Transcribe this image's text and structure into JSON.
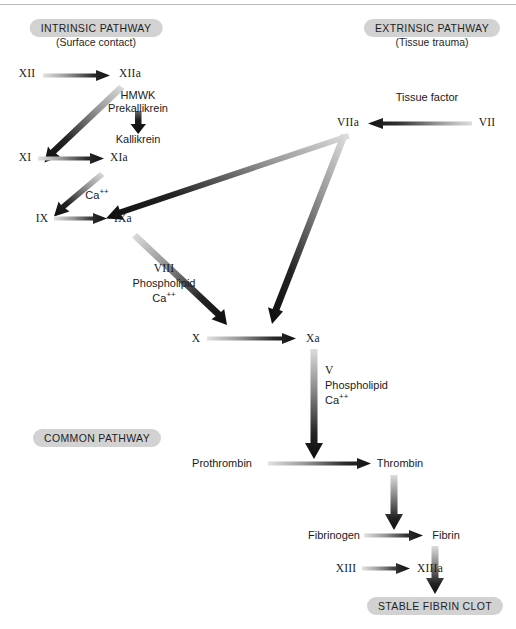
{
  "figure": {
    "top_rule": true
  },
  "pathways": [
    {
      "id": "intrinsic",
      "pill": "INTRINSIC PATHWAY",
      "caption": "(Surface contact)"
    },
    {
      "id": "extrinsic",
      "pill": "EXTRINSIC PATHWAY",
      "caption": "(Tissue trauma)"
    },
    {
      "id": "common",
      "pill": "COMMON PATHWAY",
      "caption": ""
    }
  ],
  "factors": {
    "xii": "XII",
    "xiia": "XIIa",
    "xi": "XI",
    "xia": "XIa",
    "ix": "IX",
    "ixa": "IXa",
    "x": "X",
    "xa": "Xa",
    "xiii": "XIII",
    "xiiia": "XIIIa",
    "vii": "VII",
    "viia": "VIIa",
    "prothrombin": "Prothrombin",
    "thrombin": "Thrombin",
    "fibrinogen": "Fibrinogen",
    "fibrin": "Fibrin",
    "kallikrein": "Kallikrein"
  },
  "cofactors": {
    "hmwk": "HMWK",
    "prekallikrein": "Prekallikrein",
    "tissue_factor": "Tissue factor",
    "ca_xi_ix": "Ca",
    "viii": "VIII",
    "phospholipid_viii": "Phospholipid",
    "ca_viii": "Ca",
    "v": "V",
    "phospholipid_v": "Phospholipid",
    "ca_v": "Ca",
    "charge_sup": "++"
  },
  "outcome": {
    "label": "STABLE FIBRIN CLOT"
  },
  "colors": {
    "pill_fill": "#d2d2d2",
    "text": "#1a1a1a",
    "arrow_dark": "#111111",
    "arrow_light": "#d9d9d9",
    "background": "#ffffff",
    "rule": "#b9b9bd"
  },
  "arrows": [
    {
      "name": "xii-to-xiia",
      "from": "XII",
      "to": "XIIa",
      "direction": "right"
    },
    {
      "name": "xiia-to-xi",
      "from": "XIIa",
      "to": "XI",
      "direction": "down-left"
    },
    {
      "name": "prekallikrein-to-kallikrein",
      "from": "Prekallikrein",
      "to": "Kallikrein",
      "direction": "down"
    },
    {
      "name": "xi-to-xia",
      "from": "XI",
      "to": "XIa",
      "direction": "right"
    },
    {
      "name": "xia-to-ix",
      "from": "XIa",
      "to": "IX",
      "direction": "down-left"
    },
    {
      "name": "ix-to-ixa",
      "from": "IX",
      "to": "IXa",
      "direction": "right"
    },
    {
      "name": "viia-to-ixa",
      "from": "VIIa",
      "to": "IXa",
      "direction": "down-left"
    },
    {
      "name": "vii-to-viia",
      "from": "VII",
      "to": "VIIa",
      "direction": "left"
    },
    {
      "name": "ixa-to-x",
      "from": "IXa",
      "to": "X",
      "direction": "down-right"
    },
    {
      "name": "viia-to-xa",
      "from": "VIIa",
      "to": "Xa",
      "direction": "down-left"
    },
    {
      "name": "x-to-xa",
      "from": "X",
      "to": "Xa",
      "direction": "right"
    },
    {
      "name": "xa-to-prothrombin",
      "from": "Xa",
      "to": "Prothrombin",
      "direction": "down"
    },
    {
      "name": "prothrombin-to-thrombin",
      "from": "Prothrombin",
      "to": "Thrombin",
      "direction": "right"
    },
    {
      "name": "thrombin-to-fibrinogen",
      "from": "Thrombin",
      "to": "Fibrinogen",
      "direction": "down"
    },
    {
      "name": "fibrinogen-to-fibrin",
      "from": "Fibrinogen",
      "to": "Fibrin",
      "direction": "right"
    },
    {
      "name": "xiii-to-xiiia",
      "from": "XIII",
      "to": "XIIIa",
      "direction": "right"
    },
    {
      "name": "fibrin-to-clot",
      "from": "Fibrin",
      "to": "STABLE FIBRIN CLOT",
      "direction": "down"
    }
  ]
}
